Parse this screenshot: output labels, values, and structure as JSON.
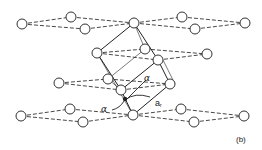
{
  "figure": {
    "panel_label": "(b)",
    "angle_label": "α",
    "angle_label_2": "α",
    "lattice_label": "a",
    "lattice_subscript": "r",
    "colors": {
      "line": "#333333",
      "circle_fill": "#ffffff",
      "background": "#ffffff"
    }
  },
  "layers": [
    {
      "name": "top",
      "atoms": [
        [
          22,
          24
        ],
        [
          71,
          17
        ],
        [
          85,
          29
        ],
        [
          134,
          23
        ],
        [
          182,
          17
        ],
        [
          195,
          29
        ],
        [
          245,
          23
        ]
      ]
    },
    {
      "name": "second",
      "atoms": [
        [
          97,
          53
        ],
        [
          145,
          49
        ],
        [
          158,
          60
        ],
        [
          207,
          54
        ]
      ]
    },
    {
      "name": "third",
      "atoms": [
        [
          59,
          83
        ],
        [
          108,
          79
        ],
        [
          121,
          90
        ],
        [
          170,
          84
        ]
      ]
    },
    {
      "name": "bottom",
      "atoms": [
        [
          21,
          116
        ],
        [
          70,
          109
        ],
        [
          83,
          122
        ],
        [
          133,
          115
        ],
        [
          181,
          109
        ],
        [
          194,
          122
        ],
        [
          244,
          116
        ]
      ]
    }
  ]
}
